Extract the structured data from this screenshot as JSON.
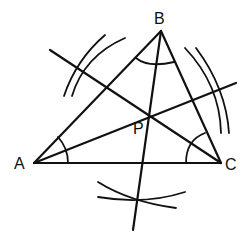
{
  "diagram": {
    "points": {
      "A": {
        "label": "A",
        "x": 34,
        "y": 163
      },
      "B": {
        "label": "B",
        "x": 161,
        "y": 31
      },
      "C": {
        "label": "C",
        "x": 221,
        "y": 163
      },
      "P": {
        "label": "P",
        "x": 149,
        "y": 117
      }
    },
    "labels": {
      "A": "A",
      "B": "B",
      "C": "C",
      "P": "P"
    },
    "bisectors": [
      {
        "from": "A",
        "through": "P",
        "name": "bisector-of-angle-A"
      },
      {
        "from": "B",
        "through": "P",
        "name": "bisector-of-angle-B"
      },
      {
        "from": "C",
        "through": "P",
        "name": "bisector-of-angle-C"
      }
    ],
    "angle_marks": [
      "A",
      "B",
      "C"
    ],
    "construction_arcs": [
      "upper-left",
      "right",
      "bottom"
    ],
    "stroke_color": "#111111",
    "background": "#ffffff"
  }
}
